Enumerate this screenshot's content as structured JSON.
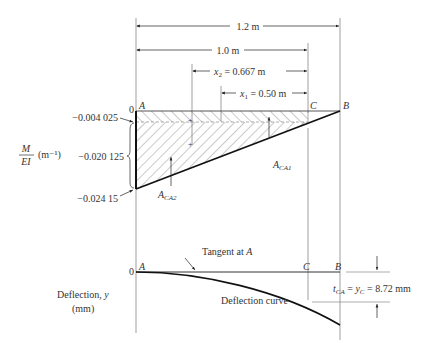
{
  "dimensions": {
    "total": "1.2 m",
    "ac": "1.0 m",
    "x2": "x",
    "x2_sub": "2",
    "x2_value": " = 0.667 m",
    "x1": "x",
    "x1_sub": "1",
    "x1_value": " = 0.50 m"
  },
  "points": {
    "a": "A",
    "b": "B",
    "c": "C",
    "zero": "0"
  },
  "moment_diagram": {
    "ylabel_num": "M",
    "ylabel_den": "EI",
    "ylabel_unit": "(m⁻¹)",
    "values": [
      "−0.004 025",
      "−0.020 125",
      "−0.024 15"
    ],
    "area1": "A",
    "area1_sub": "CA1",
    "area2": "A",
    "area2_sub": "CA2"
  },
  "deflection_diagram": {
    "ylabel_line1": "Deflection, ",
    "ylabel_var": "y",
    "ylabel_line2": "(mm)",
    "tangent_label": "Tangent at ",
    "tangent_point": "A",
    "curve_label": "Deflection curve",
    "result_t": "t",
    "result_t_sub": "CA",
    "result_eq": " = ",
    "result_y": "y",
    "result_y_sub": "C",
    "result_value": " = 8.72 mm"
  },
  "colors": {
    "line": "#222222",
    "hatch": "#555555",
    "thin": "#666666"
  }
}
